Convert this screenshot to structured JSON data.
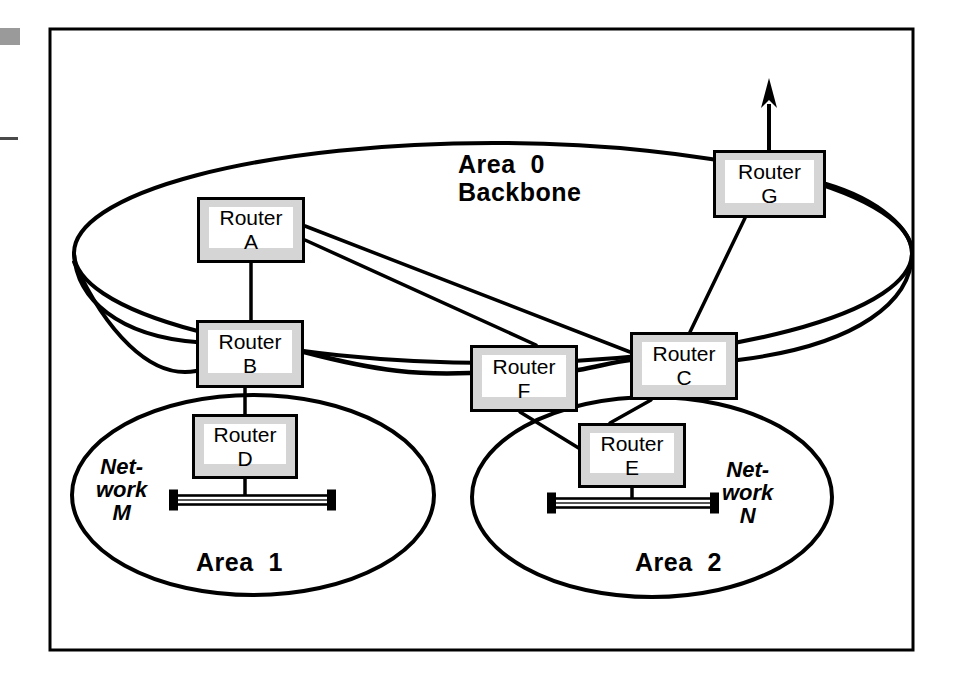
{
  "figure": {
    "frame": {
      "x": 50,
      "y": 29,
      "width": 863,
      "height": 621,
      "border_color": "#000000",
      "border_width": 3
    },
    "background": "#ffffff",
    "line_color": "#000000",
    "box_fill": "#d5d5d5",
    "box_inner_fill": "#ffffff"
  },
  "page_artifacts": [
    {
      "name": "scan-mark-grey-block",
      "x": 0,
      "y": 28,
      "width": 20,
      "height": 17,
      "color": "#9a9a9a"
    },
    {
      "name": "scan-mark-rule",
      "x": 0,
      "y": 137,
      "width": 18,
      "height": 3,
      "color": "#4a4a4a"
    }
  ],
  "areas": [
    {
      "id": "area0",
      "label_line1": "Area  0",
      "label_line2": "Backbone",
      "label_x": 458,
      "label_y": 150,
      "ellipse": {
        "cx": 493,
        "cy": 253,
        "rx": 419,
        "ry": 110,
        "stroke_width": 4
      }
    },
    {
      "id": "area1",
      "label_line1": "Area  1",
      "label_line2": "",
      "label_x": 196,
      "label_y": 548,
      "ellipse": {
        "cx": 253,
        "cy": 495,
        "rx": 181,
        "ry": 100,
        "stroke_width": 4
      }
    },
    {
      "id": "area2",
      "label_line1": "Area  2",
      "label_line2": "",
      "label_x": 635,
      "label_y": 548,
      "ellipse": {
        "cx": 652,
        "cy": 497,
        "rx": 180,
        "ry": 100,
        "stroke_width": 4
      }
    }
  ],
  "routers": [
    {
      "id": "A",
      "line1": "Router",
      "line2": "A",
      "x": 197,
      "y": 197,
      "w": 108,
      "h": 66
    },
    {
      "id": "B",
      "line1": "Router",
      "line2": "B",
      "x": 196,
      "y": 320,
      "w": 108,
      "h": 68
    },
    {
      "id": "C",
      "line1": "Router",
      "line2": "C",
      "x": 630,
      "y": 332,
      "w": 108,
      "h": 68
    },
    {
      "id": "D",
      "line1": "Router",
      "line2": "D",
      "x": 192,
      "y": 414,
      "w": 106,
      "h": 65
    },
    {
      "id": "E",
      "line1": "Router",
      "line2": "E",
      "x": 578,
      "y": 423,
      "w": 108,
      "h": 65
    },
    {
      "id": "F",
      "line1": "Router",
      "line2": "F",
      "x": 470,
      "y": 345,
      "w": 108,
      "h": 67
    },
    {
      "id": "G",
      "line1": "Router",
      "line2": "G",
      "x": 713,
      "y": 150,
      "w": 113,
      "h": 68
    }
  ],
  "networks": [
    {
      "id": "M",
      "label_line1": "Net-",
      "label_line2": "work",
      "label_line3": "M",
      "label_x": 96,
      "label_y": 455,
      "bar": {
        "x1": 176,
        "x2": 329,
        "y": 500,
        "cap_height": 21,
        "cap_width": 7,
        "bar_height": 9
      }
    },
    {
      "id": "N",
      "label_line1": "Net-",
      "label_line2": "work",
      "label_line3": "N",
      "label_x": 722,
      "label_y": 458,
      "bar": {
        "x1": 554,
        "x2": 712,
        "y": 503,
        "cap_height": 21,
        "cap_width": 7,
        "bar_height": 9
      }
    }
  ],
  "links": [
    {
      "from": "A",
      "to": "B",
      "kind": "straight",
      "path": "M 251 263 L 251 320"
    },
    {
      "from": "A",
      "to": "C",
      "kind": "straight",
      "path": "M 305 226 L 630 352"
    },
    {
      "from": "A",
      "to": "F",
      "kind": "straight",
      "path": "M 305 240 L 536 345"
    },
    {
      "from": "B",
      "to": "F",
      "kind": "curve",
      "path": "M 304 352 C 380 372 420 375 470 373"
    },
    {
      "from": "F",
      "to": "C",
      "kind": "curve",
      "path": "M 578 370 C 600 366 614 362 630 360"
    },
    {
      "from": "B",
      "to": "D",
      "kind": "straight",
      "path": "M 245 388 L 245 414"
    },
    {
      "from": "C",
      "to": "G",
      "kind": "straight",
      "path": "M 690 332 L 745 218"
    },
    {
      "from": "C",
      "to": "E",
      "kind": "straight",
      "path": "M 651 400 L 610 423"
    },
    {
      "from": "F",
      "to": "E",
      "kind": "straight",
      "path": "M 520 412 L 590 455"
    },
    {
      "from": "D",
      "to": "M",
      "kind": "straight",
      "path": "M 245 479 L 245 500"
    },
    {
      "from": "E",
      "to": "N",
      "kind": "straight",
      "path": "M 632 488 L 632 503"
    },
    {
      "from": "G",
      "to": "external",
      "kind": "arrow",
      "path": "M 769 150 L 769 78"
    }
  ],
  "area_boundary_links": [
    {
      "name": "backbone-left-edge-to-B",
      "path": "M 74 253 C 76 300 120 336 196 342"
    },
    {
      "name": "backbone-bottom-to-B",
      "path": "M 196 371 C 150 380 105 330 74 262"
    },
    {
      "name": "backbone-right-to-G",
      "path": "M 826 184 C 880 200 912 230 912 253"
    },
    {
      "name": "backbone-right-down",
      "path": "M 912 253 C 912 300 860 345 738 360"
    }
  ]
}
